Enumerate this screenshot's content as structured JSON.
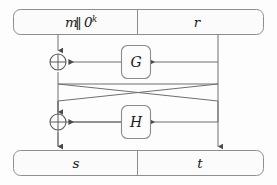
{
  "figure": {
    "name": "oaep-padding-diagram",
    "background_color": "#fdfdfd",
    "line_color": "#6f6f6f",
    "box_fill": "#fcfcfc",
    "box_stroke": "#8b8b8b",
    "text_color": "#1a1a1a"
  },
  "top_bar": {
    "left_cell": {
      "label": "m",
      "separator": "‖",
      "zeros_base": "0",
      "zeros_exponent": "k",
      "full_text": "m ‖ 0^k"
    },
    "right_cell": {
      "label": "r"
    }
  },
  "bottom_bar": {
    "left_cell": {
      "label": "s"
    },
    "right_cell": {
      "label": "t"
    }
  },
  "functions": [
    {
      "id": "G",
      "label": "G",
      "input_from": "r",
      "output_to": "xor-top"
    },
    {
      "id": "H",
      "label": "H",
      "input_from": "s",
      "output_to": "xor-bottom"
    }
  ],
  "operators": [
    {
      "id": "xor-top",
      "symbol": "⊕",
      "name": "xor-gate-top"
    },
    {
      "id": "xor-bottom",
      "symbol": "⊕",
      "name": "xor-gate-bottom"
    }
  ],
  "wires": [
    {
      "name": "m-down-to-xor-top",
      "from": "top_bar.left_cell",
      "to": "xor-top"
    },
    {
      "name": "r-down-right-rail",
      "from": "top_bar.right_cell",
      "to": "t"
    },
    {
      "name": "r-into-G",
      "from": "r-rail",
      "to": "G"
    },
    {
      "name": "G-into-xor-top",
      "from": "G",
      "to": "xor-top"
    },
    {
      "name": "xor-top-to-s",
      "from": "xor-top",
      "to": "bottom_bar.left_cell"
    },
    {
      "name": "s-cross-to-H-input",
      "from": "xor-top-branch",
      "to": "H"
    },
    {
      "name": "H-into-xor-bottom",
      "from": "H",
      "to": "xor-bottom"
    },
    {
      "name": "r-cross-to-xor-bottom-rail",
      "from": "r-rail",
      "to": "xor-bottom"
    },
    {
      "name": "xor-bottom-to-t-rail",
      "from": "xor-bottom",
      "to": "bottom_bar.right_cell"
    }
  ]
}
